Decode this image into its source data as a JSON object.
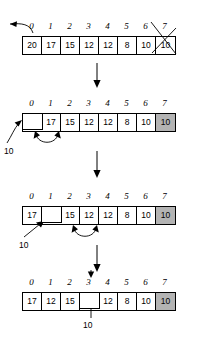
{
  "figure": {
    "cell_width": 19,
    "indices": [
      "0",
      "1",
      "2",
      "3",
      "4",
      "5",
      "6",
      "7"
    ],
    "held_value": "10",
    "colors": {
      "ink": "#000000",
      "shaded_cell": "#b3b3b3",
      "background": "#ffffff"
    }
  },
  "steps": [
    {
      "name": "step-1-remove-last",
      "indices": [
        "0",
        "1",
        "2",
        "3",
        "4",
        "5",
        "6",
        "7"
      ],
      "cells": [
        {
          "value": "20",
          "state": "normal"
        },
        {
          "value": "17",
          "state": "normal"
        },
        {
          "value": "15",
          "state": "normal"
        },
        {
          "value": "12",
          "state": "normal"
        },
        {
          "value": "12",
          "state": "normal"
        },
        {
          "value": "8",
          "state": "normal"
        },
        {
          "value": "10",
          "state": "crossed"
        },
        {
          "value": "10",
          "state": "crossed"
        }
      ],
      "annotations": {
        "left_arrow": "extract-arrow",
        "cross_index": "7"
      }
    },
    {
      "name": "step-2-hole-at-0",
      "indices": [
        "0",
        "1",
        "2",
        "3",
        "4",
        "5",
        "6",
        "7"
      ],
      "cells": [
        {
          "value": "",
          "state": "hole"
        },
        {
          "value": "17",
          "state": "normal"
        },
        {
          "value": "15",
          "state": "normal"
        },
        {
          "value": "12",
          "state": "normal"
        },
        {
          "value": "12",
          "state": "normal"
        },
        {
          "value": "8",
          "state": "normal"
        },
        {
          "value": "10",
          "state": "normal"
        },
        {
          "value": "10",
          "state": "shaded"
        }
      ],
      "annotations": {
        "held_label": "10",
        "swap_from": "1",
        "swap_to": "2"
      }
    },
    {
      "name": "step-3-hole-at-1",
      "indices": [
        "0",
        "1",
        "2",
        "3",
        "4",
        "5",
        "6",
        "7"
      ],
      "cells": [
        {
          "value": "17",
          "state": "normal"
        },
        {
          "value": "",
          "state": "hole"
        },
        {
          "value": "15",
          "state": "normal"
        },
        {
          "value": "12",
          "state": "normal"
        },
        {
          "value": "12",
          "state": "normal"
        },
        {
          "value": "8",
          "state": "normal"
        },
        {
          "value": "10",
          "state": "normal"
        },
        {
          "value": "10",
          "state": "shaded"
        }
      ],
      "annotations": {
        "held_label": "10",
        "swap_from": "3",
        "swap_to": "4"
      }
    },
    {
      "name": "step-4-hole-at-3",
      "indices": [
        "0",
        "1",
        "2",
        "3",
        "4",
        "5",
        "6",
        "7"
      ],
      "cells": [
        {
          "value": "17",
          "state": "normal"
        },
        {
          "value": "12",
          "state": "normal"
        },
        {
          "value": "15",
          "state": "normal"
        },
        {
          "value": "",
          "state": "hole"
        },
        {
          "value": "12",
          "state": "normal"
        },
        {
          "value": "8",
          "state": "normal"
        },
        {
          "value": "10",
          "state": "normal"
        },
        {
          "value": "10",
          "state": "shaded"
        }
      ],
      "annotations": {
        "held_label": "10",
        "insert_index": "3"
      }
    }
  ]
}
